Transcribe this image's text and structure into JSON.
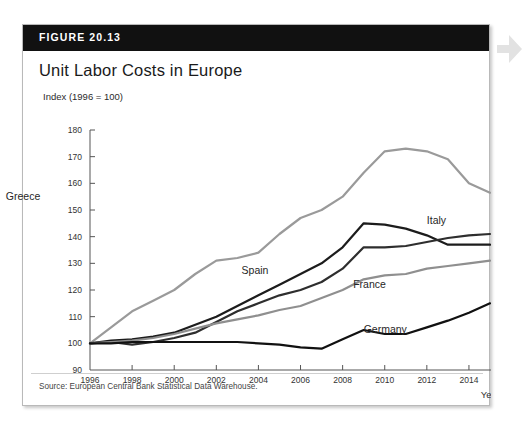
{
  "figure": {
    "number_label": "FIGURE 20.13",
    "title": "Unit Labor Costs in Europe",
    "source": "Source: European Central Bank Statistical Data Warehouse."
  },
  "colors": {
    "header_bg": "#111111",
    "header_text": "#ffffff",
    "card_bg": "#ffffff",
    "greece": "#9a9a9a",
    "spain": "#1c1c1c",
    "italy": "#2e2e2e",
    "france": "#8f8f8f",
    "germany": "#111111",
    "axis": "#555555"
  },
  "chart_data": {
    "type": "line",
    "title": "Unit Labor Costs in Europe",
    "ylabel": "Index (1996 = 100)",
    "xlabel": "Year",
    "ylim": [
      90,
      180
    ],
    "xlim": [
      1996,
      2015
    ],
    "yticks": [
      90,
      100,
      110,
      120,
      130,
      140,
      150,
      160,
      170,
      180
    ],
    "xticks": [
      1996,
      1998,
      2000,
      2002,
      2004,
      2006,
      2008,
      2010,
      2012,
      2014
    ],
    "grid": false,
    "legend": "inline-labels",
    "x": [
      1996,
      1997,
      1998,
      1999,
      2000,
      2001,
      2002,
      2003,
      2004,
      2005,
      2006,
      2007,
      2008,
      2009,
      2010,
      2011,
      2012,
      2013,
      2014,
      2015
    ],
    "series": [
      {
        "name": "Greece",
        "color": "#9a9a9a",
        "label_x": 1992.0,
        "label_y": 155,
        "values": [
          100,
          106,
          112,
          116,
          120,
          126,
          131,
          132,
          134,
          141,
          147,
          150,
          155,
          164,
          172,
          173,
          172,
          169,
          160,
          156.5
        ]
      },
      {
        "name": "Spain",
        "color": "#1c1c1c",
        "label_x": 2003.2,
        "label_y": 127,
        "values": [
          100,
          101,
          101.5,
          102.5,
          104,
          107,
          110,
          114,
          118,
          122,
          126,
          130,
          136,
          145,
          144.5,
          143,
          140.5,
          137,
          137,
          137
        ]
      },
      {
        "name": "Italy",
        "color": "#2e2e2e",
        "label_x": 2012.0,
        "label_y": 146,
        "values": [
          100,
          100.5,
          99.5,
          100.5,
          102,
          104,
          108,
          112,
          115,
          118,
          120,
          123,
          128,
          136,
          136,
          136.5,
          138,
          139.5,
          140.5,
          141
        ]
      },
      {
        "name": "France",
        "color": "#8f8f8f",
        "label_x": 2008.5,
        "label_y": 122,
        "values": [
          100,
          100.5,
          101,
          102,
          103.5,
          105.5,
          107.5,
          109,
          110.5,
          112.5,
          114,
          117,
          120,
          124,
          125.5,
          126,
          128,
          129,
          130,
          131
        ]
      },
      {
        "name": "Germany",
        "color": "#111111",
        "label_x": 2009.0,
        "label_y": 105,
        "values": [
          100,
          100,
          100.5,
          100.5,
          100.5,
          100.5,
          100.5,
          100.5,
          100,
          99.5,
          98.5,
          98,
          101.5,
          105,
          103.5,
          103.5,
          106,
          108.5,
          111.5,
          115
        ]
      }
    ]
  }
}
